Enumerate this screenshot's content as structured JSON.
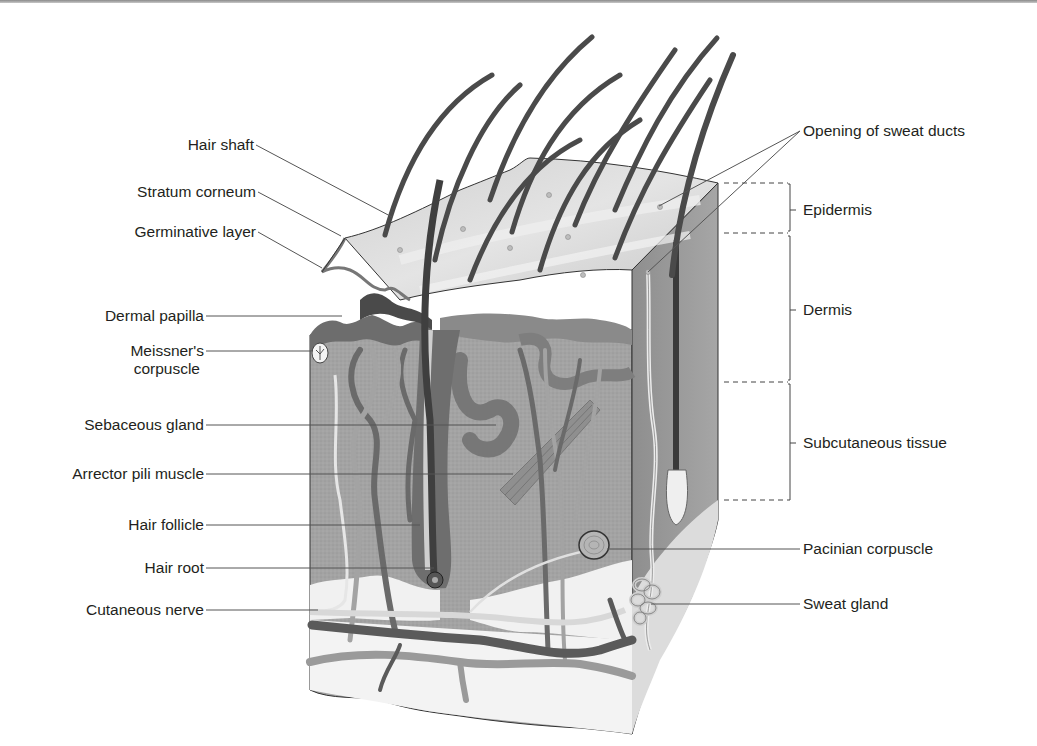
{
  "figure": {
    "colors": {
      "background": "#ffffff",
      "hair": "#4a4a4a",
      "epidermis_surface": "#d9d9d9",
      "dermis": "#9e9e9e",
      "dermis_light": "#b9b9b9",
      "subcutaneous": "#e6e6e6",
      "vessel_dark": "#5a5a5a",
      "vessel_light": "#a8a8a8",
      "leader_line": "#555555",
      "text": "#231f20"
    }
  },
  "labels_left": [
    {
      "id": "hair-shaft",
      "text": "Hair shaft"
    },
    {
      "id": "stratum-corneum",
      "text": "Stratum corneum"
    },
    {
      "id": "germinative-layer",
      "text": "Germinative layer"
    },
    {
      "id": "dermal-papilla",
      "text": "Dermal papilla"
    },
    {
      "id": "meissners-corpuscle",
      "line1": "Meissner's",
      "line2": "corpuscle"
    },
    {
      "id": "sebaceous-gland",
      "text": "Sebaceous gland"
    },
    {
      "id": "arrector-pili-muscle",
      "text": "Arrector pili muscle"
    },
    {
      "id": "hair-follicle",
      "text": "Hair follicle"
    },
    {
      "id": "hair-root",
      "text": "Hair root"
    },
    {
      "id": "cutaneous-nerve",
      "text": "Cutaneous nerve"
    }
  ],
  "labels_right": [
    {
      "id": "opening-of-sweat-ducts",
      "text": "Opening of sweat ducts"
    },
    {
      "id": "pacinian-corpuscle",
      "text": "Pacinian corpuscle"
    },
    {
      "id": "sweat-gland",
      "text": "Sweat gland"
    }
  ],
  "layers": [
    {
      "id": "epidermis",
      "text": "Epidermis"
    },
    {
      "id": "dermis",
      "text": "Dermis"
    },
    {
      "id": "subcutaneous-tissue",
      "text": "Subcutaneous tissue"
    }
  ]
}
